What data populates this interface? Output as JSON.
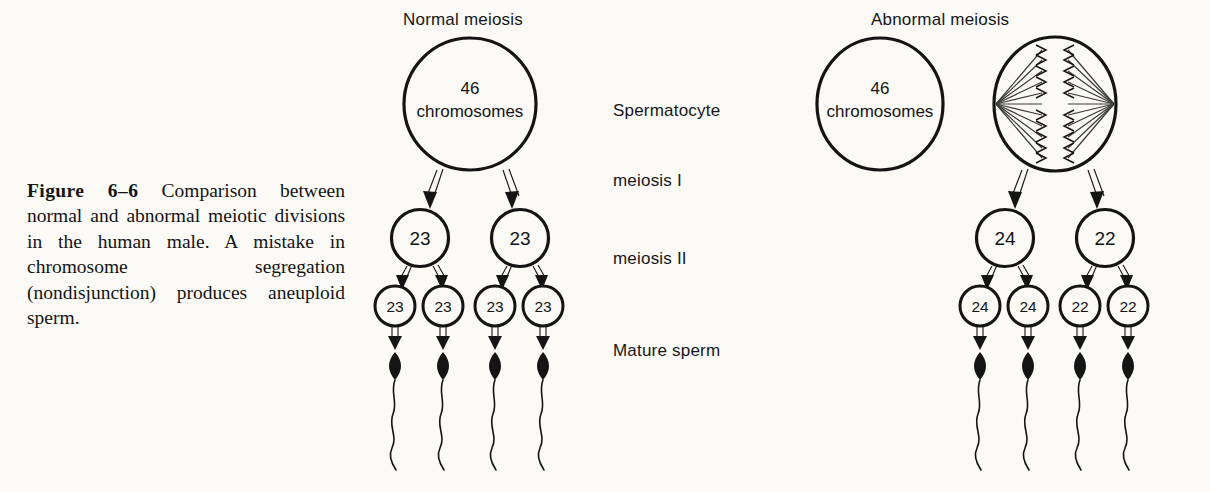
{
  "figure": {
    "label": "Figure 6–6",
    "caption": "Comparison between normal and abnormal meiotic divisions in the human male. A mistake in chromosome segregation (nondisjunction) produces aneuploid sperm."
  },
  "panels": {
    "left": {
      "title": "Normal meiosis",
      "spermatocyte": {
        "count": "46",
        "unit": "chromosomes"
      },
      "meiosis_i": [
        "23",
        "23"
      ],
      "meiosis_ii": [
        "23",
        "23",
        "23",
        "23"
      ],
      "sperm_count": 4
    },
    "right": {
      "title": "Abnormal meiosis",
      "spermatocyte": {
        "count": "46",
        "unit": "chromosomes"
      },
      "meiosis_i": [
        "24",
        "22"
      ],
      "meiosis_ii": [
        "24",
        "24",
        "22",
        "22"
      ],
      "sperm_count": 4
    }
  },
  "stage_labels": [
    "Spermatocyte",
    "meiosis I",
    "meiosis II",
    "Mature sperm"
  ],
  "colors": {
    "ink": "#141414",
    "page": "#fbfaf7",
    "spindle": "#3a3a3a"
  }
}
